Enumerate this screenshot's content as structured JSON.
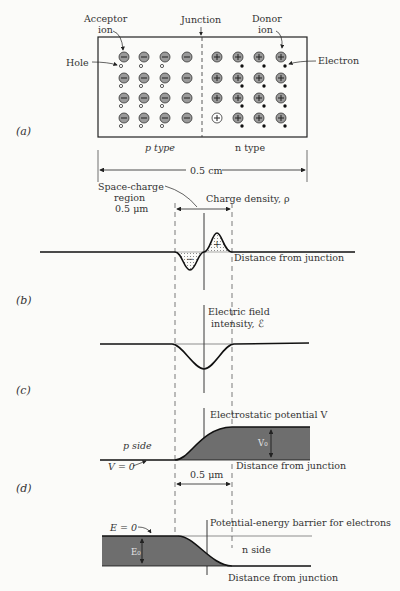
{
  "figure": {
    "parts": {
      "a": {
        "label": "(a)"
      },
      "b": {
        "label": "(b)"
      },
      "c": {
        "label": "(c)"
      },
      "d": {
        "label": "(d)"
      }
    },
    "panel_a": {
      "acceptor_label_1": "Acceptor",
      "acceptor_label_2": "ion",
      "junction_label": "Junction",
      "donor_label_1": "Donor",
      "donor_label_2": "ion",
      "hole_label": "Hole",
      "electron_label": "Electron",
      "p_type_label": "p type",
      "n_type_label": "n type",
      "width_label": "0.5 cm",
      "acceptor_symbol": "−",
      "donor_symbol": "+"
    },
    "panel_b": {
      "space_charge_1": "Space-charge",
      "space_charge_2": "region",
      "space_charge_3": "0.5 μm",
      "charge_density_label": "Charge density, ρ",
      "minus_sign": "−",
      "plus_sign": "+",
      "x_axis_label": "Distance from junction"
    },
    "panel_c": {
      "field_label_1": "Electric field",
      "field_label_2": "intensity, ℰ"
    },
    "panel_d": {
      "potential_label": "Electrostatic potential V",
      "p_side_label": "p side",
      "v_zero_label": "V = 0",
      "v0_label": "V₀",
      "width_label": "0.5 μm",
      "x_axis_label": "Distance from junction"
    },
    "panel_e": {
      "barrier_label": "Potential-energy barrier for electrons",
      "e_zero_label": "E = 0",
      "e0_label": "E₀",
      "n_side_label": "n side",
      "x_axis_label": "Distance from junction"
    },
    "colors": {
      "ion_fill": "#9a9a9a",
      "shaded_region": "#6e6e6e",
      "line": "#1a1a1a"
    }
  }
}
